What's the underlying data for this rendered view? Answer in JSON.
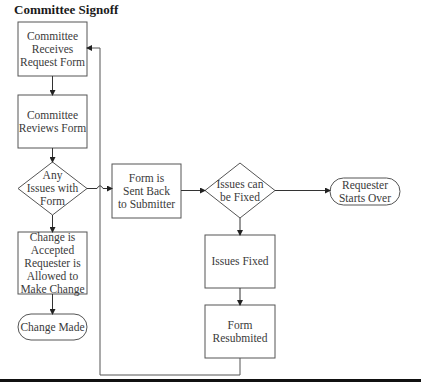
{
  "title": "Committee Signoff",
  "colors": {
    "stroke": "#555555",
    "text": "#3a3a3a",
    "rule": "#111111"
  },
  "nodes": {
    "receives": {
      "type": "process",
      "label": "Committee\nReceives\nRequest Form"
    },
    "reviews": {
      "type": "process",
      "label": "Committee\nReviews Form"
    },
    "any_issues": {
      "type": "decision",
      "label": "Any\nIssues with\nForm"
    },
    "accepted": {
      "type": "process",
      "label": "Change is\nAccepted\nRequester is\nAllowed to\nMake Change"
    },
    "change_made": {
      "type": "terminator",
      "label": "Change Made"
    },
    "sent_back": {
      "type": "process",
      "label": "Form is\nSent Back\nto Submitter"
    },
    "can_fix": {
      "type": "decision",
      "label": "Issues can\nbe Fixed"
    },
    "starts_over": {
      "type": "terminator",
      "label": "Requester\nStarts Over"
    },
    "fixed": {
      "type": "process",
      "label": "Issues Fixed"
    },
    "resubmitted": {
      "type": "process",
      "label": "Form\nResubmited"
    }
  },
  "edges": [
    {
      "from": "receives",
      "to": "reviews"
    },
    {
      "from": "reviews",
      "to": "any_issues"
    },
    {
      "from": "any_issues",
      "to": "accepted"
    },
    {
      "from": "accepted",
      "to": "change_made"
    },
    {
      "from": "any_issues",
      "to": "sent_back"
    },
    {
      "from": "sent_back",
      "to": "can_fix"
    },
    {
      "from": "can_fix",
      "to": "starts_over"
    },
    {
      "from": "can_fix",
      "to": "fixed"
    },
    {
      "from": "fixed",
      "to": "resubmitted"
    },
    {
      "from": "resubmitted",
      "to": "receives"
    }
  ]
}
